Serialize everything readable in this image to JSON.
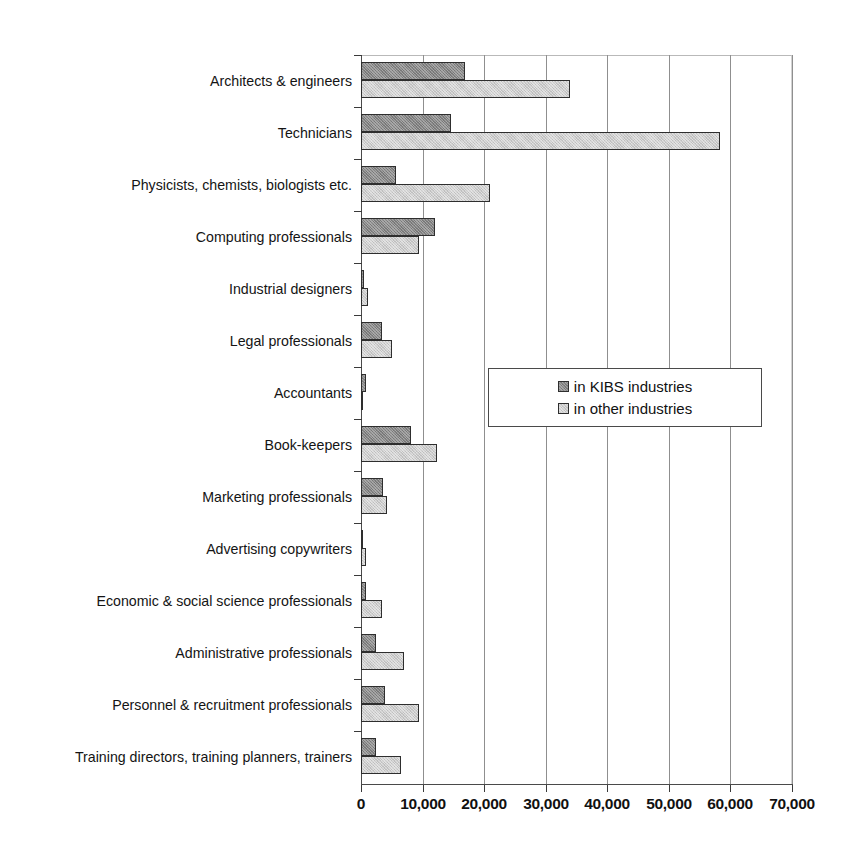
{
  "chart_data": {
    "type": "bar",
    "orientation": "horizontal",
    "title": "",
    "subtitle": "",
    "xlabel": "",
    "ylabel": "",
    "xlim": [
      0,
      70000
    ],
    "xticks": [
      0,
      10000,
      20000,
      30000,
      40000,
      50000,
      60000,
      70000
    ],
    "xtick_labels": [
      "0",
      "10,000",
      "20,000",
      "30,000",
      "40,000",
      "50,000",
      "60,000",
      "70,000"
    ],
    "grid": "vertical",
    "legend_position": "center-right-inside",
    "categories": [
      "Architects & engineers",
      "Technicians",
      "Physicists, chemists, biologists etc.",
      "Computing professionals",
      "Industrial designers",
      "Legal professionals",
      "Accountants",
      "Book-keepers",
      "Marketing professionals",
      "Advertising copywriters",
      "Economic & social science professionals",
      "Administrative professionals",
      "Personnel & recruitment professionals",
      "Training directors, training planners, trainers"
    ],
    "series": [
      {
        "name": "in KIBS industries",
        "color": "#858585",
        "values": [
          16700,
          14500,
          5500,
          11800,
          300,
          3200,
          600,
          7900,
          3400,
          100,
          700,
          2200,
          3800,
          2200
        ]
      },
      {
        "name": "in other industries",
        "color": "#cdcdcd",
        "values": [
          33800,
          58100,
          20800,
          9200,
          900,
          4900,
          200,
          12200,
          4100,
          600,
          3300,
          6800,
          9300,
          6400
        ]
      }
    ]
  },
  "legend": {
    "entries": [
      {
        "label": "in KIBS industries"
      },
      {
        "label": "in other industries"
      }
    ]
  }
}
